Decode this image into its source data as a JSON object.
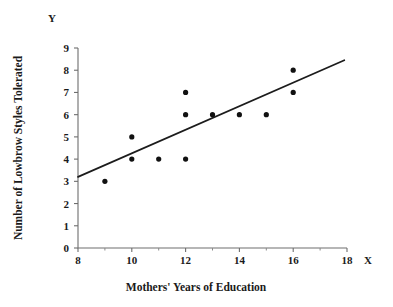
{
  "chart_data": {
    "type": "scatter",
    "title": "",
    "xlabel": "Mothers' Years of Education",
    "ylabel": "Number of Lowbrow Styles Tolerated",
    "x_axis_name": "X",
    "y_axis_name": "Y",
    "xlim": [
      8,
      18
    ],
    "ylim": [
      0,
      9
    ],
    "xticks": [
      8,
      10,
      12,
      14,
      16,
      18
    ],
    "xtick_labels": [
      "8",
      "10",
      "12",
      "14",
      "16",
      "18"
    ],
    "xminor_ticks": [
      9,
      11,
      13,
      15,
      17
    ],
    "yticks": [
      0,
      1,
      2,
      3,
      4,
      5,
      6,
      7,
      8,
      9
    ],
    "ytick_labels": [
      "0",
      "1",
      "2",
      "3",
      "4",
      "5",
      "6",
      "7",
      "8",
      "9"
    ],
    "grid": false,
    "legend": false,
    "points": [
      {
        "x": 9,
        "y": 3
      },
      {
        "x": 10,
        "y": 5
      },
      {
        "x": 10,
        "y": 4
      },
      {
        "x": 11,
        "y": 4
      },
      {
        "x": 12,
        "y": 7
      },
      {
        "x": 12,
        "y": 6
      },
      {
        "x": 12,
        "y": 4
      },
      {
        "x": 13,
        "y": 6
      },
      {
        "x": 14,
        "y": 6
      },
      {
        "x": 15,
        "y": 6
      },
      {
        "x": 16,
        "y": 8
      },
      {
        "x": 16,
        "y": 7
      }
    ],
    "trend_line": {
      "name": "regression line",
      "x1": 8,
      "y1": 3.2,
      "x2": 17.9,
      "y2": 8.45
    },
    "colors": {
      "point": "#111111",
      "line": "#1c1c1c",
      "axis": "#6e6e6e",
      "text": "#1a1a1a",
      "background": "#ffffff"
    }
  }
}
